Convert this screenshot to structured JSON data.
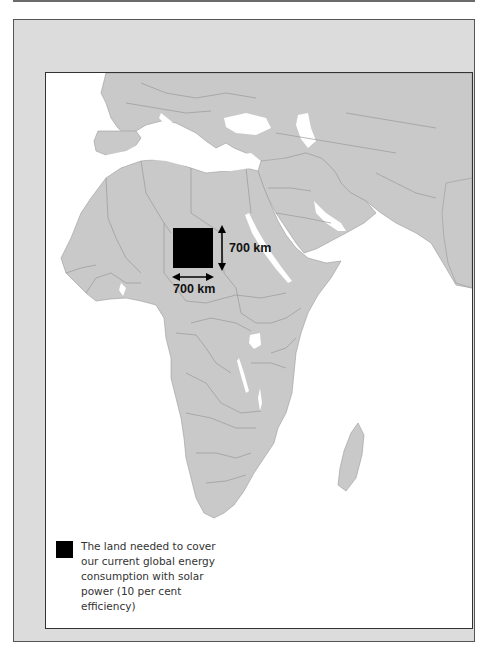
{
  "map": {
    "region": "Europe, Africa and Middle East",
    "annotation": {
      "height_label": "700 km",
      "width_label": "700 km"
    },
    "colors": {
      "land": "#c9c9c9",
      "water": "#ffffff",
      "solar_area": "#000000",
      "frame_background": "#dcdcdc"
    }
  },
  "legend": {
    "items": [
      {
        "swatch_color": "#000000",
        "label": "The land needed to cover our current global energy consumption with solar power (10 per cent efficiency)"
      }
    ]
  }
}
